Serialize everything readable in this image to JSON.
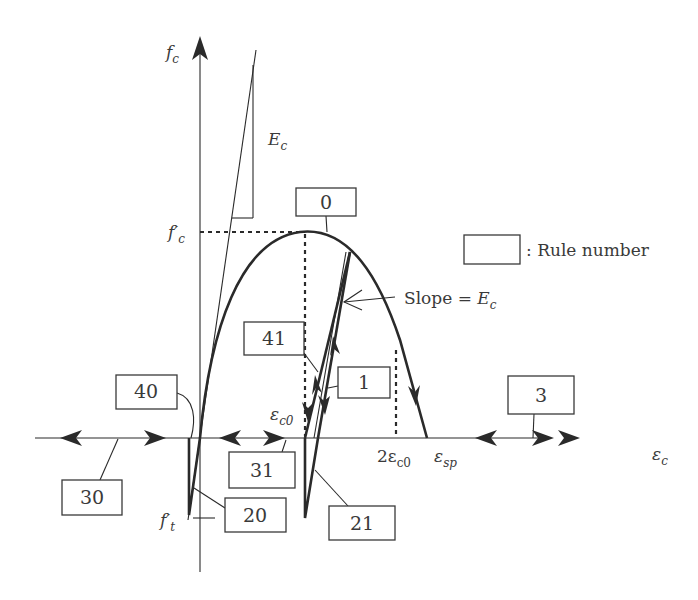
{
  "diagram": {
    "axes": {
      "y_label": "f",
      "y_label_sub": "c",
      "x_label": "ε",
      "x_label_sub": "c"
    },
    "labels": {
      "fc_prime": "f′",
      "fc_prime_sub": "c",
      "ft_prime": "f′",
      "ft_prime_sub": "t",
      "Ec": "E",
      "Ec_sub": "c",
      "eps_c0": "ε",
      "eps_c0_sub": "c0",
      "two_eps_c0": "2ε",
      "two_eps_c0_sub": "c0",
      "eps_sp": "ε",
      "eps_sp_sub": "sp",
      "slope_text": "Slope = ",
      "slope_E": "E",
      "slope_E_sub": "c"
    },
    "legend": {
      "text": ": Rule number"
    },
    "rules": [
      {
        "id": "rule-0",
        "label": "0"
      },
      {
        "id": "rule-1",
        "label": "1"
      },
      {
        "id": "rule-3",
        "label": "3"
      },
      {
        "id": "rule-20",
        "label": "20"
      },
      {
        "id": "rule-21",
        "label": "21"
      },
      {
        "id": "rule-30",
        "label": "30"
      },
      {
        "id": "rule-31",
        "label": "31"
      },
      {
        "id": "rule-40",
        "label": "40"
      },
      {
        "id": "rule-41",
        "label": "41"
      }
    ]
  }
}
